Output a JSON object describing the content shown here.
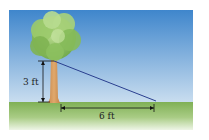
{
  "diagram": {
    "type": "tree-shadow-right-triangle",
    "tree_height_label": "3 ft",
    "shadow_length_label": "6 ft",
    "colors": {
      "sky_top": "#3f86cc",
      "sky_bottom": "#c9ddef",
      "ground_top": "#7fb055",
      "ground_bottom": "#e8f1dc",
      "trunk": "#d69a5e",
      "foliage": "#8dc05a",
      "hypotenuse": "#2a3f8f",
      "dimension_line": "#111111"
    }
  }
}
